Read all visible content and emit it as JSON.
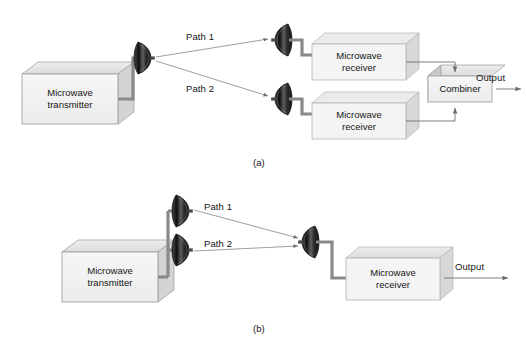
{
  "figure": {
    "subfigures": [
      {
        "id": "a",
        "caption": "(a)"
      },
      {
        "id": "b",
        "caption": "(b)"
      }
    ]
  },
  "colors": {
    "line": "#6f6f6f",
    "arrow": "#6f6f6f",
    "cable": "#8a8a8a",
    "dish_dark": "#1f1f1f",
    "dish_mid": "#555555",
    "box_face": "#f2f2f2",
    "box_top": "#e2e2e2",
    "box_side": "#d2d2d2",
    "box_edge": "#9a9a9a",
    "text": "#141414",
    "background": "#ffffff"
  },
  "diagram_a": {
    "name": "space-diversity",
    "transmitter": {
      "label_line1": "Microwave",
      "label_line2": "transmitter"
    },
    "paths": [
      {
        "label": "Path 1"
      },
      {
        "label": "Path 2"
      }
    ],
    "receivers": [
      {
        "label_line1": "Microwave",
        "label_line2": "receiver"
      },
      {
        "label_line1": "Microwave",
        "label_line2": "receiver"
      }
    ],
    "combiner": {
      "label": "Combiner"
    },
    "output": {
      "label": "Output"
    },
    "antennas": {
      "transmit_count": 1,
      "receive_count": 2
    }
  },
  "diagram_b": {
    "name": "angle-diversity",
    "transmitter": {
      "label_line1": "Microwave",
      "label_line2": "transmitter"
    },
    "paths": [
      {
        "label": "Path 1"
      },
      {
        "label": "Path 2"
      }
    ],
    "receiver": {
      "label_line1": "Microwave",
      "label_line2": "receiver"
    },
    "output": {
      "label": "Output"
    },
    "antennas": {
      "transmit_count": 2,
      "receive_count": 1
    }
  }
}
